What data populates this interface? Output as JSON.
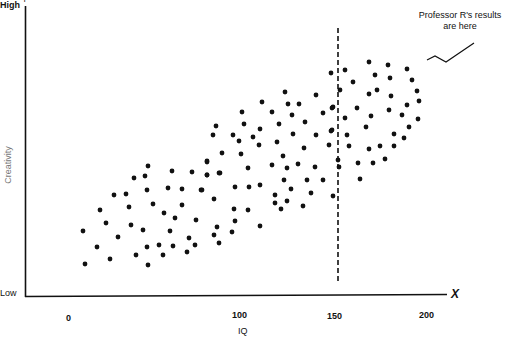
{
  "chart_data": {
    "type": "scatter",
    "title": "",
    "xlabel": "IQ",
    "ylabel": "Creativity",
    "x_axis_letter": "X",
    "y_axis_letter": "Y",
    "y_tick_labels": [
      "High",
      "Low"
    ],
    "x_ticks": [
      0,
      100,
      150,
      200
    ],
    "x_tick_labels": [
      "0",
      "100",
      "150",
      "200"
    ],
    "xlim": [
      0,
      210
    ],
    "grid": false,
    "legend": null,
    "reference_line": {
      "orientation": "vertical",
      "x": 150,
      "style": "dashed"
    },
    "annotation": {
      "text_line1": "Professor R's results",
      "text_line2": "are here",
      "pointer": "zigzag-arrow"
    },
    "points_px": [
      [
        148,
        166
      ],
      [
        134,
        178
      ],
      [
        145,
        176
      ],
      [
        172,
        171
      ],
      [
        192,
        172
      ],
      [
        207,
        162
      ],
      [
        207,
        175
      ],
      [
        219,
        173
      ],
      [
        114,
        195
      ],
      [
        126,
        194
      ],
      [
        147,
        190
      ],
      [
        168,
        188
      ],
      [
        182,
        189
      ],
      [
        201,
        190
      ],
      [
        214,
        199
      ],
      [
        100,
        210
      ],
      [
        129,
        207
      ],
      [
        153,
        204
      ],
      [
        182,
        205
      ],
      [
        164,
        213
      ],
      [
        175,
        218
      ],
      [
        196,
        220
      ],
      [
        106,
        223
      ],
      [
        131,
        225
      ],
      [
        143,
        230
      ],
      [
        170,
        231
      ],
      [
        83,
        231
      ],
      [
        118,
        237
      ],
      [
        189,
        238
      ],
      [
        217,
        227
      ],
      [
        214,
        235
      ],
      [
        97,
        247
      ],
      [
        147,
        247
      ],
      [
        159,
        245
      ],
      [
        173,
        246
      ],
      [
        195,
        245
      ],
      [
        187,
        252
      ],
      [
        219,
        243
      ],
      [
        110,
        259
      ],
      [
        136,
        255
      ],
      [
        163,
        255
      ],
      [
        85,
        264
      ],
      [
        148,
        265
      ],
      [
        285,
        92
      ],
      [
        316,
        95
      ],
      [
        262,
        102
      ],
      [
        288,
        104
      ],
      [
        299,
        104
      ],
      [
        333,
        107
      ],
      [
        242,
        112
      ],
      [
        272,
        112
      ],
      [
        292,
        115
      ],
      [
        323,
        113
      ],
      [
        216,
        126
      ],
      [
        244,
        124
      ],
      [
        279,
        124
      ],
      [
        305,
        122
      ],
      [
        260,
        129
      ],
      [
        213,
        135
      ],
      [
        233,
        135
      ],
      [
        239,
        141
      ],
      [
        253,
        137
      ],
      [
        259,
        145
      ],
      [
        277,
        142
      ],
      [
        293,
        134
      ],
      [
        316,
        135
      ],
      [
        331,
        131
      ],
      [
        329,
        145
      ],
      [
        304,
        148
      ],
      [
        222,
        153
      ],
      [
        241,
        154
      ],
      [
        283,
        156
      ],
      [
        207,
        161
      ],
      [
        272,
        165
      ],
      [
        287,
        168
      ],
      [
        298,
        164
      ],
      [
        315,
        167
      ],
      [
        248,
        168
      ],
      [
        207,
        175
      ],
      [
        220,
        173
      ],
      [
        284,
        180
      ],
      [
        307,
        180
      ],
      [
        323,
        180
      ],
      [
        260,
        185
      ],
      [
        249,
        187
      ],
      [
        235,
        187
      ],
      [
        291,
        189
      ],
      [
        202,
        190
      ],
      [
        311,
        193
      ],
      [
        275,
        195
      ],
      [
        275,
        203
      ],
      [
        287,
        201
      ],
      [
        281,
        209
      ],
      [
        303,
        206
      ],
      [
        234,
        209
      ],
      [
        248,
        210
      ],
      [
        235,
        221
      ],
      [
        260,
        226
      ],
      [
        232,
        232
      ],
      [
        369,
        62
      ],
      [
        388,
        65
      ],
      [
        407,
        69
      ],
      [
        345,
        70
      ],
      [
        375,
        75
      ],
      [
        390,
        78
      ],
      [
        412,
        80
      ],
      [
        353,
        82
      ],
      [
        340,
        90
      ],
      [
        369,
        94
      ],
      [
        377,
        90
      ],
      [
        391,
        96
      ],
      [
        417,
        91
      ],
      [
        419,
        101
      ],
      [
        407,
        105
      ],
      [
        357,
        108
      ],
      [
        389,
        110
      ],
      [
        345,
        118
      ],
      [
        371,
        116
      ],
      [
        402,
        115
      ],
      [
        418,
        119
      ],
      [
        409,
        127
      ],
      [
        366,
        127
      ],
      [
        347,
        135
      ],
      [
        394,
        134
      ],
      [
        404,
        138
      ],
      [
        349,
        146
      ],
      [
        380,
        146
      ],
      [
        394,
        146
      ],
      [
        369,
        149
      ],
      [
        385,
        159
      ],
      [
        373,
        163
      ],
      [
        358,
        163
      ],
      [
        339,
        167
      ],
      [
        338,
        160
      ],
      [
        360,
        179
      ],
      [
        333,
        196
      ],
      [
        331,
        73
      ],
      [
        332,
        108
      ],
      [
        332,
        130
      ]
    ]
  },
  "labels": {
    "y_high": "High",
    "y_low": "Low",
    "y_title": "Creativity",
    "y_letter": "Y",
    "x_letter": "X",
    "x_title": "IQ",
    "tick_0": "0",
    "tick_100": "100",
    "tick_150": "150",
    "tick_200": "200",
    "annotation_line1": "Professor R's results",
    "annotation_line2": "are here",
    "caption_fragment": "Professor R... results are ... high ... mid ..."
  }
}
